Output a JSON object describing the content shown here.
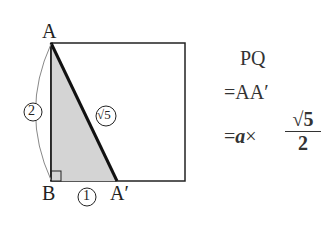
{
  "diagram": {
    "points": {
      "A": "A",
      "B": "B",
      "A_prime": "A′"
    },
    "side_labels": {
      "AB": "2",
      "BA_prime": "1",
      "AA_prime": "√5"
    },
    "colors": {
      "shade": "#d4d4d4",
      "line": "#222222"
    }
  },
  "equation": {
    "line1": "PQ",
    "line2": "=AA′",
    "line3_prefix": "=",
    "line3_var": "a",
    "line3_times": "×",
    "frac_num": "√5",
    "frac_den": "2"
  }
}
